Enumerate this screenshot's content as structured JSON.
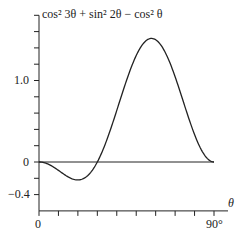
{
  "chart_data": {
    "type": "line",
    "title": "",
    "ylabel": "cos² 3θ + sin² 2θ − cos² θ",
    "xlabel": "θ",
    "xlim": [
      0,
      90
    ],
    "ylim": [
      -0.6,
      1.8
    ],
    "x_tick_labels": [
      "0",
      "90°"
    ],
    "y_tick_labels": [
      "1.0",
      "0",
      "−0.4"
    ],
    "x_ticks_deg": [
      0,
      10,
      20,
      30,
      40,
      50,
      60,
      70,
      80,
      90
    ],
    "y_ticks": [
      -0.4,
      -0.2,
      0,
      0.2,
      0.4,
      0.6,
      0.8,
      1.0,
      1.2,
      1.4,
      1.6,
      1.8
    ],
    "grid": false,
    "series": [
      {
        "name": "cos² 3θ + sin² 2θ − cos² θ",
        "x": [
          0,
          5,
          10,
          15,
          20,
          25,
          30,
          35,
          40,
          45,
          50,
          55,
          60,
          65,
          70,
          75,
          80,
          85,
          90
        ],
        "values": [
          0,
          -0.033,
          -0.113,
          -0.192,
          -0.221,
          -0.169,
          0,
          0.292,
          0.675,
          1.0,
          1.348,
          1.482,
          1.5,
          1.385,
          1.0,
          0.524,
          0.141,
          0.006,
          0
        ]
      }
    ]
  }
}
